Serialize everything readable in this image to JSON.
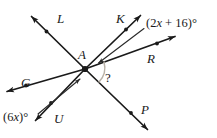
{
  "figure": {
    "type": "geometry-diagram",
    "vertex": {
      "label": "A",
      "x": 85,
      "y": 69
    },
    "rays": [
      {
        "name": "L",
        "label": "L",
        "label_x": 57,
        "label_y": 12,
        "tip_x": 31,
        "tip_y": 16,
        "tick": true
      },
      {
        "name": "K",
        "label": "K",
        "label_x": 116,
        "label_y": 12,
        "tip_x": 141,
        "tip_y": 15,
        "tick": true
      },
      {
        "name": "R",
        "label": "R",
        "label_x": 147,
        "label_y": 52,
        "tip_x": 176,
        "tip_y": 36,
        "tick": true
      },
      {
        "name": "P",
        "label": "P",
        "label_x": 141,
        "label_y": 103,
        "tip_x": 148,
        "tip_y": 130,
        "tick": true
      },
      {
        "name": "U",
        "label": "U",
        "label_x": 54,
        "label_y": 112,
        "tip_x": 35,
        "tip_y": 121,
        "tick": true
      },
      {
        "name": "G",
        "label": "G",
        "label_x": 21,
        "label_y": 76,
        "tip_x": 6,
        "tip_y": 92,
        "tick": true
      }
    ],
    "angle_labels": [
      {
        "id": "two-x-plus-16",
        "text": "(2x + 16)°",
        "x": 146,
        "y": 17,
        "leader": {
          "from_x": 144,
          "from_y": 28,
          "to_x": 97,
          "to_y": 63
        }
      },
      {
        "id": "six-x",
        "text": "(6x)°",
        "x": 3,
        "y": 111,
        "leader": {
          "from_x": 38,
          "from_y": 114,
          "to_x": 80,
          "to_y": 78
        }
      }
    ],
    "unknown_angle": {
      "marker": "?",
      "x": 105,
      "y": 76
    },
    "colors": {
      "stroke": "#1a1a1a",
      "background": "#ffffff",
      "angle_arc": "#b9b2a8"
    }
  }
}
